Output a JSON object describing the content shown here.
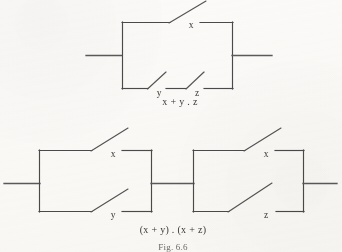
{
  "figure": {
    "caption": "Fig. 6.6",
    "background_color": "#fbfaf8",
    "ink_color": "#4a4a4a"
  },
  "circuits": [
    {
      "id": "circuit-top",
      "expression": "x + y . z",
      "description": "Parallel network: switch x in parallel with series pair y and z",
      "switches": [
        {
          "name": "x",
          "label": "x",
          "branch": "upper",
          "state": "open"
        },
        {
          "name": "y",
          "label": "y",
          "branch": "lower",
          "state": "open"
        },
        {
          "name": "z",
          "label": "z",
          "branch": "lower",
          "state": "open"
        }
      ]
    },
    {
      "id": "circuit-bottom",
      "expression": "(x + y) . (x + z)",
      "description": "Two parallel blocks in series: (x parallel y) followed by (x parallel z)",
      "blocks": [
        {
          "id": "block-left",
          "label": "(x + y)",
          "switches": [
            {
              "name": "x",
              "label": "x",
              "branch": "upper",
              "state": "open"
            },
            {
              "name": "y",
              "label": "y",
              "branch": "lower",
              "state": "open"
            }
          ]
        },
        {
          "id": "block-right",
          "label": "(x + z)",
          "switches": [
            {
              "name": "x",
              "label": "x",
              "branch": "upper",
              "state": "open"
            },
            {
              "name": "z",
              "label": "z",
              "branch": "lower",
              "state": "open"
            }
          ]
        }
      ]
    }
  ],
  "labels": {
    "top_switch_x": "x",
    "top_switch_y": "y",
    "top_switch_z": "z",
    "top_expression": "x + y . z",
    "bottom_left_switch_x": "x",
    "bottom_left_switch_y": "y",
    "bottom_right_switch_x": "x",
    "bottom_right_switch_z": "z",
    "bottom_expression": "(x + y) . (x + z)",
    "caption": "Fig. 6.6"
  }
}
